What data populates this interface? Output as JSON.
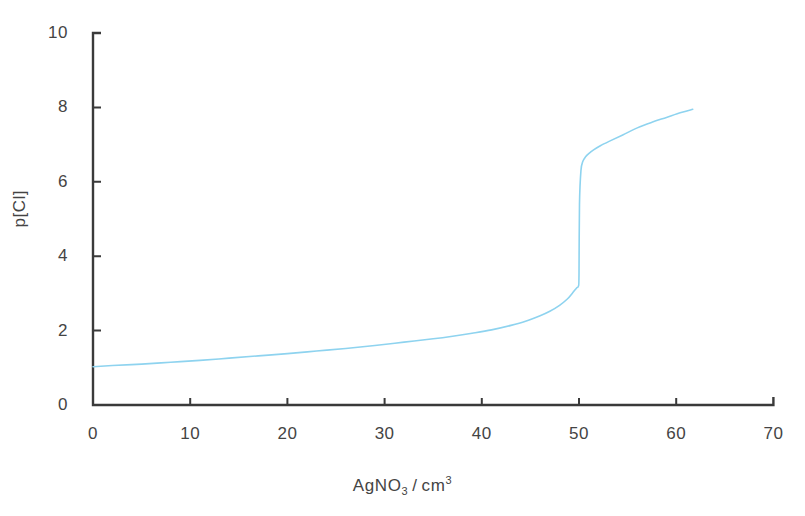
{
  "chart_data": {
    "type": "line",
    "title": "",
    "xlabel": "AgNO3 / cm3",
    "xlabel_parts": {
      "lead": "AgNO",
      "sub": "3",
      "slash": "/",
      "unit": "cm",
      "sup": "3"
    },
    "ylabel": "p[Cl]",
    "xlim": [
      0,
      70
    ],
    "ylim": [
      0,
      10
    ],
    "xticks": [
      0,
      10,
      20,
      30,
      40,
      50,
      60,
      70
    ],
    "xtick_labels": [
      "0",
      "10",
      "20",
      "30",
      "40",
      "50",
      "60",
      "70"
    ],
    "yticks": [
      0,
      2,
      4,
      6,
      8,
      10
    ],
    "ytick_labels": [
      "0",
      "2",
      "4",
      "6",
      "8",
      "10"
    ],
    "grid": false,
    "legend": null,
    "series": [
      {
        "name": "p[Cl] titration curve",
        "color": "#8ed3ef",
        "line_width": 1.6,
        "x": [
          0,
          2,
          5,
          8,
          11,
          14,
          17,
          20,
          23,
          26,
          29,
          32,
          35,
          37,
          39,
          41,
          43,
          44.5,
          46,
          47,
          48,
          48.8,
          49.3,
          49.6,
          49.8,
          49.95,
          50.0,
          50.05,
          50.2,
          50.4,
          50.7,
          51.0,
          51.5,
          52.2,
          53.2,
          54.5,
          56.0,
          57.5,
          59.0,
          60.5,
          61.7
        ],
        "y": [
          1.03,
          1.06,
          1.1,
          1.15,
          1.2,
          1.26,
          1.32,
          1.38,
          1.45,
          1.52,
          1.6,
          1.69,
          1.78,
          1.85,
          1.93,
          2.02,
          2.14,
          2.25,
          2.4,
          2.52,
          2.68,
          2.85,
          3.0,
          3.1,
          3.16,
          3.2,
          3.5,
          5.4,
          6.3,
          6.55,
          6.68,
          6.76,
          6.86,
          6.97,
          7.1,
          7.26,
          7.45,
          7.6,
          7.73,
          7.86,
          7.95
        ]
      }
    ],
    "axis_color": "#3a3a3a",
    "background_color": "#ffffff"
  },
  "axes": {
    "x_origin_px": 93,
    "y_origin_px": 405,
    "px_per_x_unit": 9.72,
    "px_per_y_unit": 37.2
  }
}
